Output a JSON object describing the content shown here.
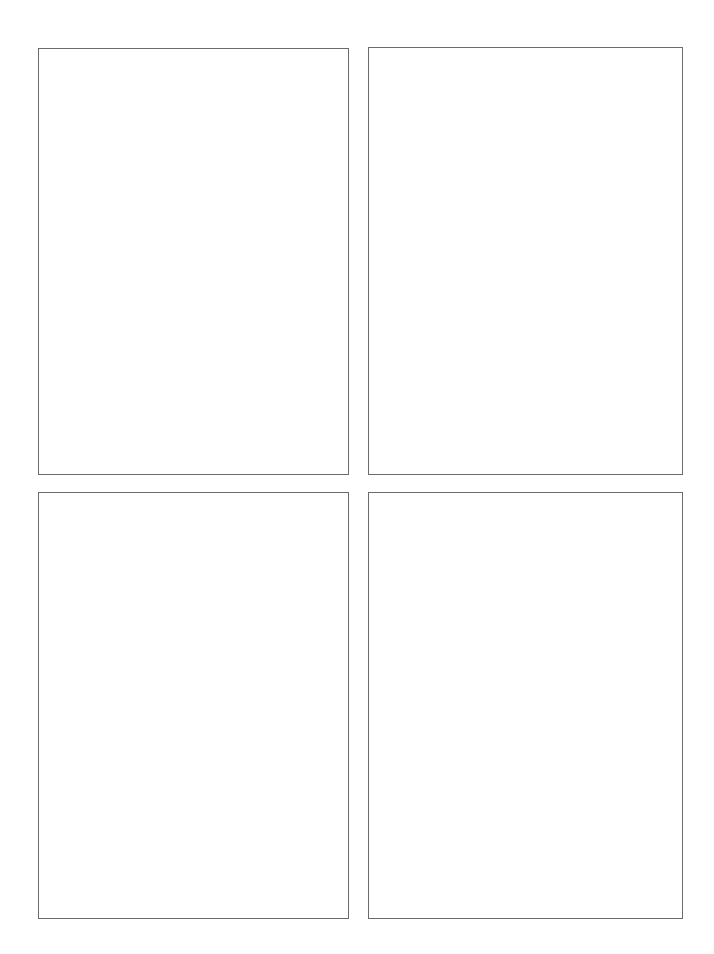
{
  "layout": {
    "grid": "2x2",
    "background_color": "#ffffff",
    "border_color": "#6b6b6b"
  },
  "panels": [
    {
      "position": "top-left",
      "content": ""
    },
    {
      "position": "top-right",
      "content": ""
    },
    {
      "position": "bottom-left",
      "content": ""
    },
    {
      "position": "bottom-right",
      "content": ""
    }
  ]
}
